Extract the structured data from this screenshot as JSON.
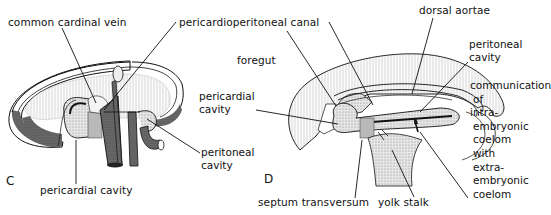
{
  "figure": {
    "panels": [
      {
        "id": "C",
        "letter": "C",
        "labels": {
          "common_cardinal_vein": "common cardinal vein",
          "pericardioperitoneal_canal": "pericardioperitoneal canal",
          "peritoneal_cavity_line1": "peritoneal",
          "peritoneal_cavity_line2": "cavity",
          "pericardial_cavity": "pericardial cavity"
        }
      },
      {
        "id": "D",
        "letter": "D",
        "labels": {
          "foregut": "foregut",
          "pericardial_cavity_line1": "pericardial",
          "pericardial_cavity_line2": "cavity",
          "dorsal_aortae": "dorsal aortae",
          "peritoneal_cavity_line1": "peritoneal",
          "peritoneal_cavity_line2": "cavity",
          "communication": [
            "communication",
            "of",
            "intra-",
            "embryonic",
            "coelom",
            "with",
            "extra-",
            "embryonic",
            "coelom"
          ],
          "septum_transversum": "septum transversum",
          "yolk_stalk": "yolk stalk"
        }
      }
    ],
    "colors": {
      "ink": "#111111",
      "stipple_dark": "#555555",
      "stipple_mid": "#9a9a9a",
      "stipple_light": "#d8d8d8",
      "background": "#ffffff"
    }
  }
}
